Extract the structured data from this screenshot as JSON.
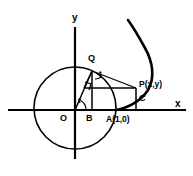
{
  "figure": {
    "background_color": "#ffffff",
    "stroke_color": "#000000",
    "axes": {
      "x_label": "x",
      "y_label": "y",
      "x_axis_y": 110,
      "y_axis_x": 75
    },
    "circle": {
      "center_x": 75,
      "center_y": 108,
      "radius": 41,
      "description": "unit circle centered at O through A(1,0)"
    },
    "points": [
      {
        "key": "O",
        "label": "O",
        "x": 75,
        "y": 110,
        "label_x": 60,
        "label_y": 114
      },
      {
        "key": "B",
        "label": "B",
        "x": 92,
        "y": 110,
        "label_x": 86,
        "label_y": 114
      },
      {
        "key": "A",
        "label": "A(1,0)",
        "x": 116,
        "y": 110,
        "label_x": 106,
        "label_y": 114
      },
      {
        "key": "Q",
        "label": "Q",
        "x": 92,
        "y": 71,
        "label_x": 88,
        "label_y": 56
      },
      {
        "key": "P",
        "label": "P(x,y)",
        "x": 136,
        "y": 88,
        "label_x": 139,
        "label_y": 80
      },
      {
        "key": "C",
        "label": "C",
        "x": 136,
        "y": 110,
        "label_x": 139,
        "label_y": 94
      }
    ],
    "angles": [
      {
        "key": "t-at-origin",
        "label": "t",
        "label_x": 78,
        "label_y": 98
      },
      {
        "key": "t-at-Q",
        "label": "t",
        "label_x": 99,
        "label_y": 74
      }
    ],
    "curve": {
      "name": "involute",
      "start_x": 116,
      "start_y": 110,
      "end_x": 128,
      "end_y": 20
    },
    "right_angle_marker": {
      "x": 84,
      "y": 82,
      "size": 6
    }
  }
}
